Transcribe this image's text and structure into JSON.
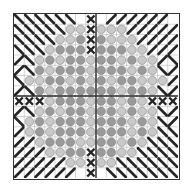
{
  "chart_title": "",
  "grid": {
    "cols": 16,
    "rows": 16,
    "center_line_col": 8,
    "center_line_row": 7
  },
  "colors": {
    "gridline": "#b8b8b8",
    "boldline": "#2a2a2a",
    "light_circle": "#c9c9c9",
    "medium_circle": "#9a9a9a",
    "circle_stroke": "#7a7a7a",
    "stitch": "#262626"
  },
  "legend_symbols": {
    "B": "blank",
    "L": "light-gray-circle",
    "M": "medium-gray-circle",
    "D": "back-slash-stitch",
    "F": "forward-slash-stitch",
    "X": "cross-stitch"
  },
  "rows": [
    "DDDDDDBXBFFFFFFB",
    "DDDDDLLXLLLFFFFF",
    "DDDDLLMXMLLLFFFF",
    "DDDLMMMXMMMLLFFF",
    "FDLMLMMLMMLMLLFD",
    "FDMLMMMLMMMLMLDF",
    "DLLMMLMLMLMMLLLF",
    "FDMLMMMMMMLMMLDF",
    "XXXLMMMLMMLMLXXX",
    "FDLMLMMLMMLMLLDF",
    "DLMLMMMLMMMLMLDF",
    "FLMLMMMLMMMLMLDD",
    "FFLMMMLLMMLMLDDD",
    "FFFLLMMXMMLLDDDD",
    "FFFFFLLXLLDDDDDD",
    "FFFFFFBXBDDDDDDD"
  ]
}
